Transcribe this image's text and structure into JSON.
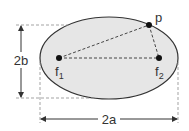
{
  "diagram": {
    "type": "ellipse-foci",
    "colors": {
      "ellipse_fill": "#e6e6e6",
      "stroke": "#333333",
      "dashed": "#999999",
      "point": "#111111"
    },
    "ellipse": {
      "cx": 109,
      "cy": 58,
      "rx": 69,
      "ry": 41
    },
    "points": [
      {
        "id": "f1",
        "label": "f",
        "subscript": "1",
        "x": 59,
        "y": 58
      },
      {
        "id": "f2",
        "label": "f",
        "subscript": "2",
        "x": 159,
        "y": 58
      },
      {
        "id": "p",
        "label": "p",
        "x": 149,
        "y": 25
      }
    ],
    "dimensions": {
      "minor_axis_label": "2b",
      "major_axis_label": "2a"
    }
  }
}
